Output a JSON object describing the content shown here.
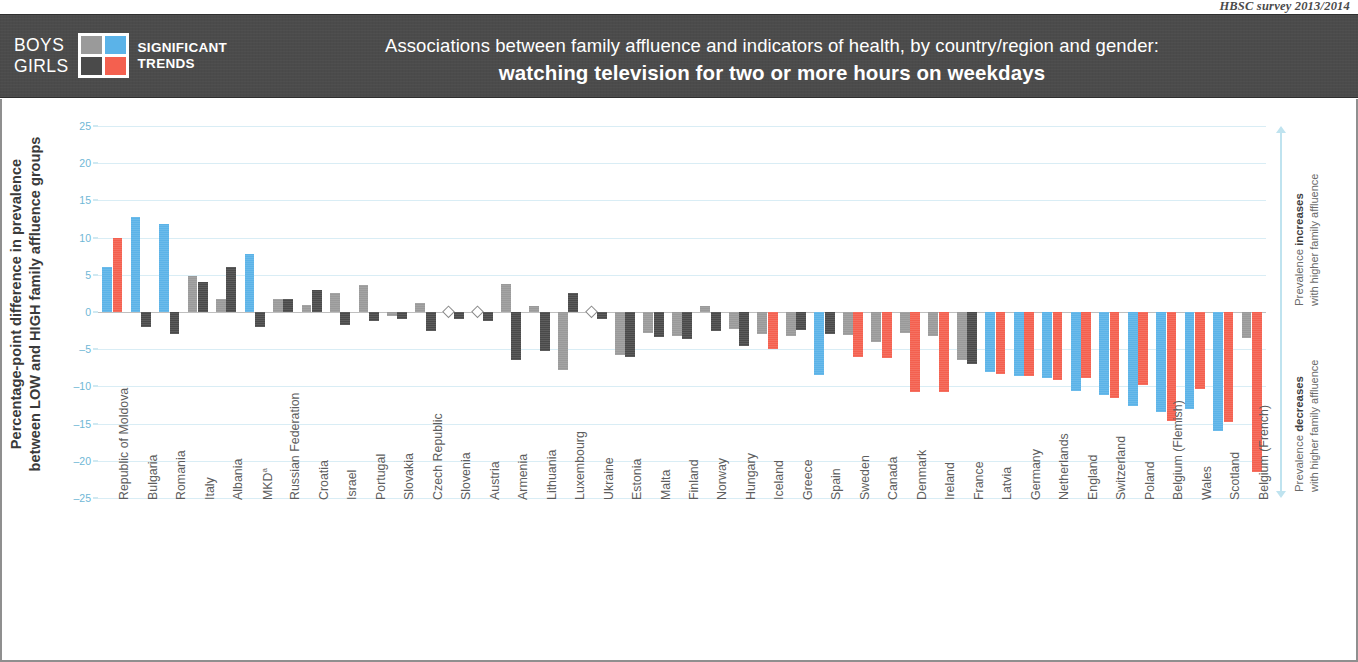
{
  "source_note": "HBSC survey 2013/2014",
  "legend": {
    "boys_label": "BOYS",
    "girls_label": "GIRLS",
    "caption_line1": "SIGNIFICANT",
    "caption_line2": "TRENDS",
    "swatch_boys_ns": "#9a9a9a",
    "swatch_boys_sig": "#5bb3e8",
    "swatch_girls_ns": "#4a4a4a",
    "swatch_girls_sig": "#f4604f"
  },
  "title": {
    "line1": "Associations between family affluence and indicators of health, by country/region and gender:",
    "line2": "watching television for two or more hours on weekdays"
  },
  "axis": {
    "y_title": "Percentage-point difference in prevalence\nbetween LOW and HIGH family affluence groups"
  },
  "side_annotations": {
    "increase_bold": "Prevalence increases",
    "increase_rest": "with higher family affluence",
    "decrease_bold": "Prevalence decreases",
    "decrease_rest": "with higher family affluence"
  },
  "chart_data": {
    "type": "bar",
    "title": "Associations between family affluence and indicators of health, by country/region and gender: watching television for two or more hours on weekdays",
    "xlabel": "",
    "ylabel": "Percentage-point difference in prevalence between LOW and HIGH family affluence groups",
    "ylim": [
      -25,
      25
    ],
    "yticks": [
      25,
      20,
      15,
      10,
      5,
      0,
      -5,
      -10,
      -15,
      -20,
      -25
    ],
    "grid": true,
    "legend_position": "header-left",
    "colors": {
      "boys_significant": "#5bb3e8",
      "boys_not_significant": "#9a9a9a",
      "girls_significant": "#f4604f",
      "girls_not_significant": "#4a4a4a",
      "no_data_marker": "diamond"
    },
    "categories": [
      "Republic of Moldova",
      "Bulgaria",
      "Romania",
      "Italy",
      "Albania",
      "MKD",
      "Russian Federation",
      "Croatia",
      "Israel",
      "Portugal",
      "Slovakia",
      "Czech Republic",
      "Slovenia",
      "Austria",
      "Armenia",
      "Lithuania",
      "Luxembourg",
      "Ukraine",
      "Estonia",
      "Malta",
      "Finland",
      "Norway",
      "Hungary",
      "Iceland",
      "Greece",
      "Spain",
      "Sweden",
      "Canada",
      "Denmark",
      "Ireland",
      "France",
      "Latvia",
      "Germany",
      "Netherlands",
      "England",
      "Switzerland",
      "Poland",
      "Belgium (Flemish)",
      "Wales",
      "Scotland",
      "Belgium (French)"
    ],
    "series": [
      {
        "name": "Boys",
        "values": [
          6.0,
          12.8,
          11.8,
          4.8,
          1.8,
          7.8,
          1.7,
          1.0,
          2.6,
          3.6,
          -0.5,
          1.2,
          null,
          null,
          3.7,
          0.8,
          -7.8,
          null,
          -5.8,
          -2.8,
          -3.2,
          0.8,
          -2.3,
          -3.0,
          -3.2,
          -8.5,
          -3.1,
          -4.0,
          -2.8,
          -3.2,
          -6.5,
          -8.0,
          -8.6,
          -8.9,
          -10.6,
          -11.2,
          -12.6,
          -13.5,
          -13.0,
          -16.0,
          -3.5
        ],
        "significance": [
          true,
          true,
          true,
          false,
          false,
          true,
          false,
          false,
          false,
          false,
          false,
          false,
          null,
          null,
          false,
          false,
          false,
          null,
          false,
          false,
          false,
          false,
          false,
          false,
          false,
          true,
          false,
          false,
          false,
          false,
          false,
          true,
          true,
          true,
          true,
          true,
          true,
          true,
          true,
          true,
          false
        ]
      },
      {
        "name": "Girls",
        "values": [
          10.0,
          -2.0,
          -3.0,
          4.0,
          6.0,
          -2.0,
          1.8,
          3.0,
          -1.8,
          -1.2,
          -1.0,
          -2.6,
          -1.0,
          -1.2,
          -6.5,
          -5.3,
          2.5,
          -1.0,
          -6.0,
          -3.3,
          -3.6,
          -2.6,
          -4.6,
          -5.0,
          -2.4,
          -3.0,
          -6.0,
          -6.2,
          -10.8,
          -10.8,
          -7.0,
          -8.3,
          -8.6,
          -9.2,
          -8.9,
          -11.5,
          -9.8,
          -14.6,
          -10.4,
          -14.8,
          -21.5
        ],
        "significance": [
          true,
          false,
          false,
          false,
          false,
          false,
          false,
          false,
          false,
          false,
          false,
          false,
          false,
          false,
          false,
          false,
          false,
          false,
          false,
          false,
          false,
          false,
          false,
          true,
          false,
          false,
          true,
          true,
          true,
          true,
          false,
          true,
          true,
          true,
          true,
          true,
          true,
          true,
          true,
          true,
          true
        ]
      }
    ]
  }
}
